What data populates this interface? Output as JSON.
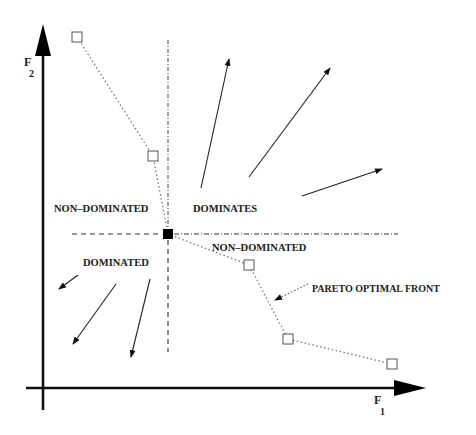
{
  "diagram": {
    "type": "pareto-dominance",
    "axes": {
      "x_label_main": "F",
      "x_label_sub": "1",
      "y_label_main": "F",
      "y_label_sub": "2"
    },
    "regions": {
      "upper_left": "NON–DOMINATED",
      "upper_right": "DOMINATES",
      "lower_right": "NON–DOMINATED",
      "lower_left": "DOMINATED"
    },
    "annotation": "PARETO OPTIMAL FRONT",
    "reference_point": {
      "x": 168,
      "y": 234
    },
    "pareto_points": [
      {
        "x": 77,
        "y": 37
      },
      {
        "x": 153,
        "y": 156
      },
      {
        "x": 249,
        "y": 265
      },
      {
        "x": 288,
        "y": 339
      },
      {
        "x": 392,
        "y": 364
      }
    ],
    "colors": {
      "line": "#111111",
      "dotted": "#666666",
      "text": "#222222"
    }
  }
}
